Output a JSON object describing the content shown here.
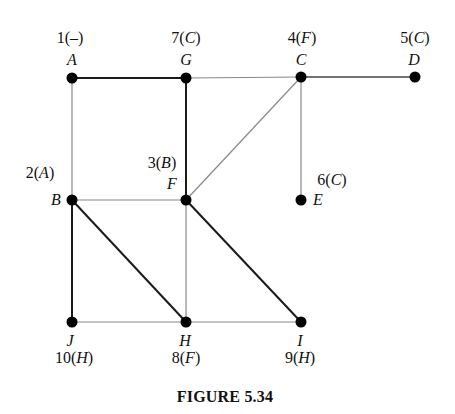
{
  "figure": {
    "caption": "FIGURE 5.34"
  },
  "nodes": [
    {
      "id": "A",
      "x": 72,
      "y": 78,
      "order": "1",
      "parent": "–",
      "name_pos": "above",
      "label_pos": "above"
    },
    {
      "id": "G",
      "x": 186,
      "y": 78,
      "order": "7",
      "parent": "C",
      "name_pos": "above",
      "label_pos": "above"
    },
    {
      "id": "C",
      "x": 301,
      "y": 77,
      "order": "4",
      "parent": "F",
      "name_pos": "above",
      "label_pos": "above"
    },
    {
      "id": "D",
      "x": 415,
      "y": 77,
      "order": "5",
      "parent": "C",
      "name_pos": "above",
      "label_pos": "above"
    },
    {
      "id": "B",
      "x": 72,
      "y": 200,
      "order": "2",
      "parent": "A",
      "name_pos": "left",
      "label_pos": "left-above"
    },
    {
      "id": "F",
      "x": 186,
      "y": 200,
      "order": "3",
      "parent": "B",
      "name_pos": "left-above",
      "label_pos": "left-above2"
    },
    {
      "id": "E",
      "x": 301,
      "y": 200,
      "order": "6",
      "parent": "C",
      "name_pos": "right",
      "label_pos": "right-above"
    },
    {
      "id": "J",
      "x": 72,
      "y": 322,
      "order": "10",
      "parent": "H",
      "name_pos": "below",
      "label_pos": "below"
    },
    {
      "id": "H",
      "x": 186,
      "y": 322,
      "order": "8",
      "parent": "F",
      "name_pos": "below",
      "label_pos": "below"
    },
    {
      "id": "I",
      "x": 301,
      "y": 322,
      "order": "9",
      "parent": "H",
      "name_pos": "below",
      "label_pos": "below"
    }
  ],
  "edges": [
    {
      "from": "A",
      "to": "G",
      "weight": "bold"
    },
    {
      "from": "G",
      "to": "C",
      "weight": "light"
    },
    {
      "from": "C",
      "to": "D",
      "weight": "normal"
    },
    {
      "from": "A",
      "to": "B",
      "weight": "light"
    },
    {
      "from": "G",
      "to": "F",
      "weight": "bold"
    },
    {
      "from": "C",
      "to": "F",
      "weight": "light"
    },
    {
      "from": "C",
      "to": "E",
      "weight": "light"
    },
    {
      "from": "B",
      "to": "F",
      "weight": "light"
    },
    {
      "from": "B",
      "to": "J",
      "weight": "bold"
    },
    {
      "from": "B",
      "to": "H",
      "weight": "bold"
    },
    {
      "from": "F",
      "to": "H",
      "weight": "light"
    },
    {
      "from": "F",
      "to": "I",
      "weight": "bold"
    },
    {
      "from": "J",
      "to": "H",
      "weight": "light"
    },
    {
      "from": "H",
      "to": "I",
      "weight": "light"
    }
  ],
  "labels": {
    "A": {
      "num": "1(",
      "par": "–",
      "close": ")"
    },
    "G": {
      "num": "7(",
      "par": "C",
      "close": ")"
    },
    "C": {
      "num": "4(",
      "par": "F",
      "close": ")"
    },
    "D": {
      "num": "5(",
      "par": "C",
      "close": ")"
    },
    "B": {
      "num": "2(",
      "par": "A",
      "close": ")"
    },
    "F": {
      "num": "3(",
      "par": "B",
      "close": ")"
    },
    "E": {
      "num": "6(",
      "par": "C",
      "close": ")"
    },
    "J": {
      "num": "10(",
      "par": "H",
      "close": ")"
    },
    "H": {
      "num": "8(",
      "par": "F",
      "close": ")"
    },
    "I": {
      "num": "9(",
      "par": "H",
      "close": ")"
    }
  },
  "names": {
    "A": "A",
    "G": "G",
    "C": "C",
    "D": "D",
    "B": "B",
    "F": "F",
    "E": "E",
    "J": "J",
    "H": "H",
    "I": "I"
  }
}
